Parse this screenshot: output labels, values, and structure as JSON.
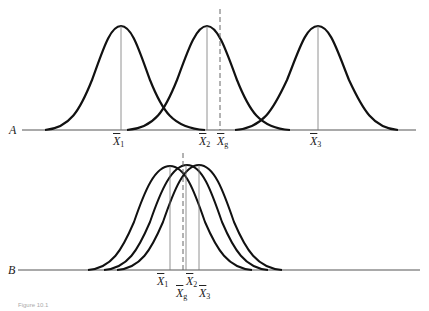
{
  "panels": {
    "A": {
      "letter": "A",
      "labels": [
        {
          "id": "x1",
          "main": "X",
          "sub": "1"
        },
        {
          "id": "x2",
          "main": "X",
          "sub": "2"
        },
        {
          "id": "xg",
          "main": "X",
          "sub": "g"
        },
        {
          "id": "x3",
          "main": "X",
          "sub": "3"
        }
      ]
    },
    "B": {
      "letter": "B",
      "labels": [
        {
          "id": "x1",
          "main": "X",
          "sub": "1"
        },
        {
          "id": "xg",
          "main": "X",
          "sub": "g"
        },
        {
          "id": "x2",
          "main": "X",
          "sub": "2"
        },
        {
          "id": "x3",
          "main": "X",
          "sub": "3"
        }
      ]
    }
  },
  "caption": "Figure 10.1",
  "colors": {
    "curve": "#111111",
    "guide": "#666666",
    "axis": "#444444"
  }
}
